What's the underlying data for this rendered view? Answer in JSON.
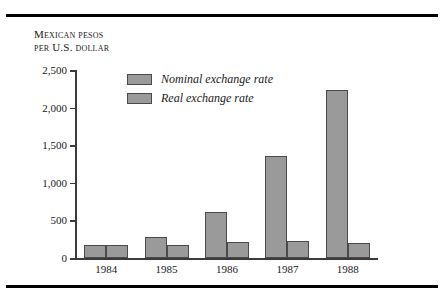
{
  "figure": {
    "caption_lines": [
      "Mexican pesos",
      "per U.S. dollar"
    ]
  },
  "chart_data": {
    "type": "bar",
    "title": "",
    "xlabel": "",
    "ylabel": "Mexican pesos per U.S. dollar",
    "categories": [
      "1984",
      "1985",
      "1986",
      "1987",
      "1988"
    ],
    "series": [
      {
        "name": "Nominal exchange rate",
        "values": [
          170,
          280,
          610,
          1360,
          2240
        ]
      },
      {
        "name": "Real exchange rate",
        "values": [
          170,
          170,
          215,
          225,
          200
        ]
      }
    ],
    "ylim": [
      0,
      2500
    ],
    "yticks": [
      0,
      500,
      1000,
      1500,
      2000,
      2500
    ],
    "ytick_labels": [
      "0",
      "500",
      "1,000",
      "1,500",
      "2,000",
      "2,500"
    ],
    "grid": false,
    "legend_position": "top-left-inside",
    "bar_fill": "#9a9a9a",
    "bar_stroke": "#4a4a4a",
    "axis_color": "#3b3b3b",
    "background": "#ffffff"
  }
}
